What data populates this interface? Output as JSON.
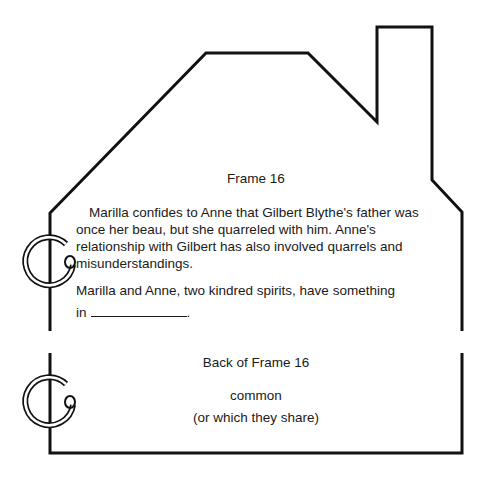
{
  "frame": {
    "title": "Frame 16",
    "paragraph": "Marilla confides to Anne that Gilbert Blythe's father was once her beau, but she quarreled with him. Anne's relationship with Gilbert has also involved quarrels and misunderstandings.",
    "prompt": "Marilla and Anne, two kindred spirits, have something",
    "prompt_end_prefix": "in",
    "prompt_end_suffix": "."
  },
  "back": {
    "title": "Back of Frame 16",
    "answer": "common",
    "alternate": "(or which they share)"
  },
  "colors": {
    "ink": "#1a1a1a",
    "background": "#ffffff"
  },
  "icons": {
    "binder_ring_top": "binder-ring-icon",
    "binder_ring_bottom": "binder-ring-icon"
  }
}
